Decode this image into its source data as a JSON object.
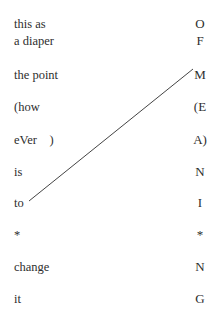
{
  "poem": {
    "left_column": [
      {
        "text": "this as",
        "y": 17
      },
      {
        "text": "a diaper",
        "y": 34
      },
      {
        "text": "the point",
        "y": 68
      },
      {
        "text": "(how",
        "y": 100
      },
      {
        "text": "eVer    )",
        "y": 133
      },
      {
        "text": "is",
        "y": 165
      },
      {
        "text": "to",
        "y": 196
      },
      {
        "text": "*",
        "y": 228
      },
      {
        "text": "change",
        "y": 260
      },
      {
        "text": "it",
        "y": 292
      }
    ],
    "right_column": [
      {
        "text": "O",
        "y": 17
      },
      {
        "text": "F",
        "y": 34
      },
      {
        "text": "M",
        "y": 68
      },
      {
        "text": "(E",
        "y": 100
      },
      {
        "text": "A)",
        "y": 133
      },
      {
        "text": "N",
        "y": 165
      },
      {
        "text": "I",
        "y": 196
      },
      {
        "text": "*",
        "y": 228
      },
      {
        "text": "N",
        "y": 260
      },
      {
        "text": "G",
        "y": 292
      }
    ],
    "connector_line": {
      "from_word": "to",
      "to_letter": "M",
      "x1": 29,
      "y1": 201,
      "x2": 193,
      "y2": 69,
      "color": "#444444"
    }
  }
}
